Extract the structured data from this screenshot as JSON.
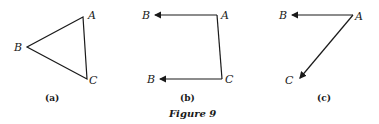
{
  "figure": {
    "caption": "Figure 9",
    "panels": [
      {
        "id": "a",
        "caption": "(a)",
        "labels": {
          "A": "A",
          "B": "B",
          "C": "C"
        },
        "description": "Triangle ABC with undirected edges"
      },
      {
        "id": "b",
        "caption": "(b)",
        "labels": {
          "A": "A",
          "B_top": "B",
          "B_bottom": "B",
          "C": "C"
        },
        "description": "Edge A→B, edge A–C, edge C→B"
      },
      {
        "id": "c",
        "caption": "(c)",
        "labels": {
          "A": "A",
          "B": "B",
          "C": "C"
        },
        "description": "Edges A→B and A→C"
      }
    ]
  }
}
